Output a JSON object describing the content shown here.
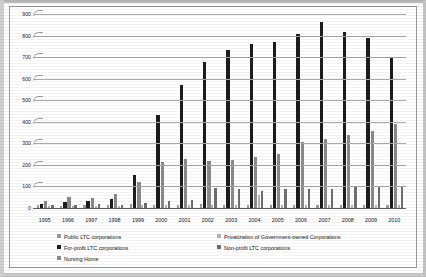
{
  "chart_data": {
    "type": "bar",
    "title": "",
    "xlabel": "",
    "ylabel": "",
    "ylim": [
      0,
      900
    ],
    "yticks": [
      0,
      100,
      200,
      300,
      400,
      500,
      600,
      700,
      800,
      900
    ],
    "grid": true,
    "legend_position": "bottom",
    "categories": [
      "1995",
      "1996",
      "1997",
      "1998",
      "1999",
      "2000",
      "2001",
      "2002",
      "2003",
      "2004",
      "2005",
      "2006",
      "2007",
      "2008",
      "2009",
      "2010"
    ],
    "series": [
      {
        "name": "Public LTC corporations",
        "color": "#9a9a9a",
        "values": [
          12,
          10,
          14,
          12,
          18,
          14,
          16,
          18,
          16,
          14,
          12,
          14,
          14,
          12,
          12,
          14
        ]
      },
      {
        "name": "For-profit LTC corporations",
        "color": "#1c1c1c",
        "values": [
          20,
          30,
          34,
          40,
          152,
          432,
          570,
          678,
          735,
          760,
          772,
          806,
          862,
          818,
          788,
          700
        ]
      },
      {
        "name": "Nursing Home",
        "color": "#8a8a8a",
        "values": [
          34,
          52,
          46,
          66,
          120,
          215,
          228,
          220,
          222,
          238,
          252,
          306,
          320,
          340,
          356,
          388
        ]
      },
      {
        "name": "Privatization of Government-owned Corporations",
        "color": "#b3b3b3",
        "values": [
          8,
          8,
          10,
          10,
          12,
          12,
          14,
          12,
          14,
          60,
          14,
          12,
          12,
          12,
          14,
          12
        ]
      },
      {
        "name": "Non-profit LTC corporations",
        "color": "#6f6f6f",
        "values": [
          16,
          14,
          18,
          16,
          24,
          34,
          38,
          92,
          86,
          80,
          86,
          88,
          90,
          96,
          98,
          102
        ]
      }
    ]
  },
  "axis": {
    "ytick_labels": [
      "900",
      "800",
      "700",
      "600",
      "500",
      "400",
      "300",
      "200",
      "100",
      "0"
    ]
  },
  "legend": {
    "items": [
      {
        "label": "Public LTC corporations",
        "swatch": "sw-public"
      },
      {
        "label": "Privatization of Government-owned Corporations",
        "swatch": "sw-priv"
      },
      {
        "label": "For-profit LTC corporations",
        "swatch": "sw-forprofit"
      },
      {
        "label": "Non-profit LTC corporations",
        "swatch": "sw-nonprofit"
      },
      {
        "label": "Nursing Home",
        "swatch": "sw-nursing"
      }
    ]
  }
}
